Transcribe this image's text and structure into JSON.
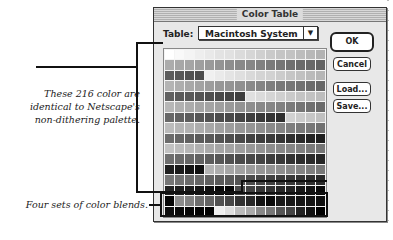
{
  "dialog": {
    "title": "Color Table",
    "table_label": "Table:",
    "table_value": "Macintosh System",
    "buttons": {
      "ok": "OK",
      "cancel": "Cancel",
      "load": "Load...",
      "save": "Save..."
    }
  },
  "annotations": {
    "palette_note": [
      "These 216 color are",
      "identical to Netscape's",
      "non-dithering palette."
    ],
    "blends_note": "Four sets of color blends."
  },
  "grid": {
    "columns": 16,
    "rows": 16
  }
}
